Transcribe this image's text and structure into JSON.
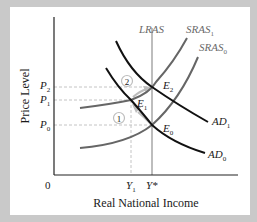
{
  "diagram": {
    "y_axis_label": "Price Level",
    "x_axis_label": "Real National Income",
    "origin_label": "0",
    "price_levels": [
      {
        "id": "P2",
        "base": "P",
        "sub": "2"
      },
      {
        "id": "P1",
        "base": "P",
        "sub": "1"
      },
      {
        "id": "P0",
        "base": "P",
        "sub": "0"
      }
    ],
    "income_levels": [
      {
        "id": "Y1",
        "base": "Y",
        "sub": "1"
      },
      {
        "id": "Ystar",
        "base": "Y*",
        "sub": ""
      }
    ],
    "curves": [
      {
        "id": "LRAS",
        "base": "LRAS",
        "sub": "",
        "color": "#8a8a8a"
      },
      {
        "id": "SRAS1",
        "base": "SRAS",
        "sub": "1",
        "color": "#6a6a6a"
      },
      {
        "id": "SRAS0",
        "base": "SRAS",
        "sub": "0",
        "color": "#6a6a6a"
      },
      {
        "id": "AD1",
        "base": "AD",
        "sub": "1",
        "color": "#111111"
      },
      {
        "id": "AD0",
        "base": "AD",
        "sub": "0",
        "color": "#111111"
      }
    ],
    "equilibria": [
      {
        "id": "E2",
        "base": "E",
        "sub": "2"
      },
      {
        "id": "E1",
        "base": "E",
        "sub": "1"
      },
      {
        "id": "E0",
        "base": "E",
        "sub": "0"
      }
    ],
    "steps": [
      {
        "id": "step1",
        "label": "1"
      },
      {
        "id": "step2",
        "label": "2"
      }
    ],
    "colors": {
      "frame": "#c9c9c9",
      "panel": "#ffffff",
      "axis": "#222222",
      "guide": "#c4c4c4",
      "arrow": "#bdbdbd"
    }
  }
}
